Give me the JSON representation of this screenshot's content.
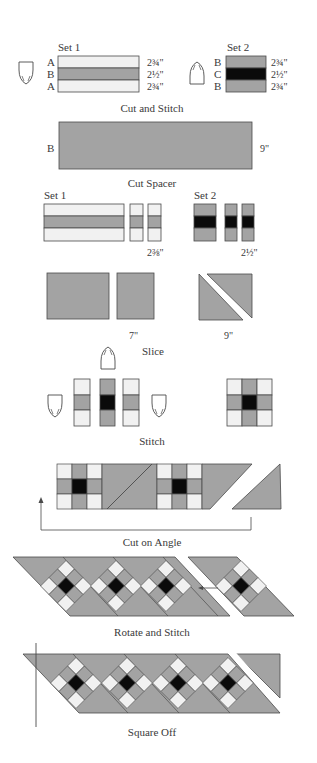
{
  "colors": {
    "light": "#f1f1f1",
    "medium": "#a3a3a3",
    "dark": "#0a0a0a",
    "outline": "#4a4a4a",
    "background": "#ffffff"
  },
  "steps": {
    "cut_and_stitch": {
      "caption": "Cut and Stitch",
      "set1": {
        "title": "Set 1",
        "rows": [
          {
            "letter": "A",
            "fabric": "light",
            "width": "2¾\""
          },
          {
            "letter": "B",
            "fabric": "medium",
            "width": "2½\""
          },
          {
            "letter": "A",
            "fabric": "light",
            "width": "2¾\""
          }
        ],
        "press_icon": "iron-pointing-down"
      },
      "set2": {
        "title": "Set 2",
        "rows": [
          {
            "letter": "B",
            "fabric": "medium",
            "width": "2¾\""
          },
          {
            "letter": "C",
            "fabric": "dark",
            "width": "2½\""
          },
          {
            "letter": "B",
            "fabric": "medium",
            "width": "2¾\""
          }
        ],
        "press_icon": "iron-pointing-up"
      }
    },
    "cut_spacer": {
      "caption": "Cut Spacer",
      "letter": "B",
      "width": "9\""
    },
    "subcut": {
      "set1_title": "Set 1",
      "set2_title": "Set 2",
      "set1_width": "2⅜\"",
      "set2_width": "2½\""
    },
    "slice": {
      "caption": "Slice",
      "square_size": "7\"",
      "triangle_size": "9\""
    },
    "stitch": {
      "caption": "Stitch",
      "icons": [
        "iron-pointing-up",
        "iron-pointing-down",
        "iron-pointing-down"
      ]
    },
    "cut_on_angle": {
      "caption": "Cut on Angle"
    },
    "rotate_and_stitch": {
      "caption": "Rotate and Stitch"
    },
    "square_off": {
      "caption": "Square Off"
    }
  }
}
